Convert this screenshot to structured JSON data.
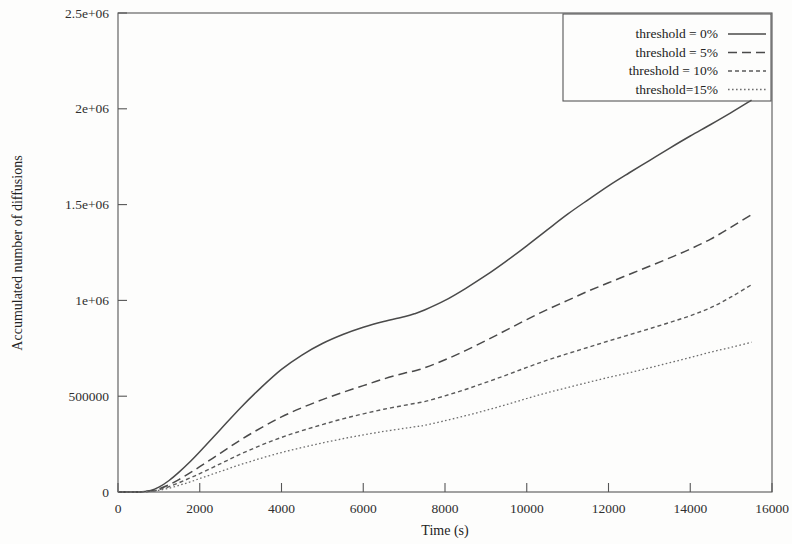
{
  "chart_data": {
    "type": "line",
    "title": "",
    "xlabel": "Time (s)",
    "ylabel": "Accumulated number of diffusions",
    "xlim": [
      0,
      16000
    ],
    "ylim": [
      0,
      2500000
    ],
    "grid": false,
    "legend_position": "top-right",
    "xticks": [
      0,
      2000,
      4000,
      6000,
      8000,
      10000,
      12000,
      14000,
      16000
    ],
    "xticklabels": [
      "0",
      "2000",
      "4000",
      "6000",
      "8000",
      "10000",
      "12000",
      "14000",
      "16000"
    ],
    "yticks": [
      0,
      500000,
      1000000,
      1500000,
      2000000,
      2500000
    ],
    "yticklabels": [
      "0",
      "500000",
      "1e+06",
      "1.5e+06",
      "2e+06",
      "2.5e+06"
    ],
    "x": [
      0,
      500,
      800,
      1000,
      1250,
      1500,
      1750,
      2000,
      2500,
      3000,
      3500,
      4000,
      4500,
      5000,
      5500,
      6000,
      6500,
      7000,
      7250,
      7500,
      8000,
      8500,
      9000,
      9500,
      10000,
      10500,
      11000,
      11500,
      12000,
      12500,
      13000,
      13500,
      14000,
      14500,
      15000,
      15500
    ],
    "series": [
      {
        "name": "threshold = 0%",
        "label": "threshold = 0%",
        "style": "solid",
        "color": "#4a4a4a",
        "dash": "none",
        "width": 1.5,
        "values": [
          0,
          0,
          8000,
          25000,
          60000,
          105000,
          155000,
          210000,
          325000,
          440000,
          545000,
          640000,
          715000,
          775000,
          822000,
          860000,
          890000,
          915000,
          930000,
          950000,
          1000000,
          1062000,
          1130000,
          1205000,
          1285000,
          1368000,
          1450000,
          1525000,
          1598000,
          1665000,
          1730000,
          1795000,
          1858000,
          1918000,
          1980000,
          2045000
        ]
      },
      {
        "name": "threshold = 5%",
        "label": "threshold = 5%",
        "style": "dashed",
        "color": "#4a4a4a",
        "dash": "9,5",
        "width": 1.5,
        "values": [
          0,
          0,
          5000,
          16000,
          38000,
          66000,
          98000,
          132000,
          202000,
          272000,
          335000,
          392000,
          440000,
          482000,
          520000,
          555000,
          590000,
          620000,
          632000,
          648000,
          690000,
          738000,
          790000,
          845000,
          900000,
          952000,
          1000000,
          1048000,
          1092000,
          1135000,
          1178000,
          1222000,
          1268000,
          1320000,
          1382000,
          1448000
        ]
      },
      {
        "name": "threshold = 10%",
        "label": "threshold = 10%",
        "style": "dotted-dash",
        "color": "#5a5a5a",
        "dash": "4,3",
        "width": 1.4,
        "values": [
          0,
          0,
          4000,
          12000,
          28000,
          49000,
          72000,
          96000,
          147000,
          198000,
          244000,
          285000,
          320000,
          352000,
          382000,
          408000,
          432000,
          452000,
          462000,
          472000,
          502000,
          535000,
          572000,
          610000,
          650000,
          688000,
          722000,
          755000,
          788000,
          820000,
          852000,
          885000,
          920000,
          962000,
          1018000,
          1082000
        ]
      },
      {
        "name": "threshold=15%",
        "label": "threshold=15%",
        "style": "dotted",
        "color": "#6e6e6e",
        "dash": "1.6,2.4",
        "width": 1.3,
        "values": [
          0,
          0,
          3000,
          9000,
          20000,
          35000,
          52000,
          70000,
          107000,
          143000,
          176000,
          206000,
          232000,
          256000,
          278000,
          298000,
          316000,
          332000,
          340000,
          348000,
          372000,
          398000,
          426000,
          456000,
          488000,
          518000,
          545000,
          572000,
          598000,
          622000,
          648000,
          675000,
          702000,
          730000,
          755000,
          782000
        ]
      }
    ]
  },
  "legend": {
    "entries": [
      {
        "label": "threshold = 0%"
      },
      {
        "label": "threshold = 5%"
      },
      {
        "label": "threshold = 10%"
      },
      {
        "label": "threshold=15%"
      }
    ]
  }
}
